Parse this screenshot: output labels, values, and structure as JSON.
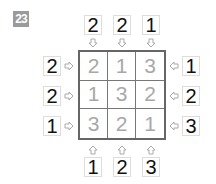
{
  "puzzle_number": "23",
  "grid": [
    [
      "2",
      "1",
      "3"
    ],
    [
      "1",
      "3",
      "2"
    ],
    [
      "3",
      "2",
      "1"
    ]
  ],
  "clues": {
    "top": [
      "2",
      "2",
      "1"
    ],
    "bottom": [
      "1",
      "2",
      "3"
    ],
    "left": [
      "2",
      "2",
      "1"
    ],
    "right": [
      "1",
      "2",
      "3"
    ]
  },
  "colors": {
    "badge": "#9a9a9a",
    "grid_digit": "#a8a8a8",
    "clue_digit": "#111111",
    "arrow": "#aaaaaa"
  }
}
